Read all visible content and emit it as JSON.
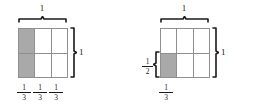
{
  "figure": {
    "type": "fraction-area-model",
    "diagrams": [
      {
        "id": "left",
        "columns": 3,
        "rows": 2,
        "top_brace_label": "1",
        "right_brace_label": "1",
        "shaded_cells": [
          {
            "row": 0,
            "column": 0
          },
          {
            "row": 1,
            "column": 0
          }
        ],
        "shaded_count": 2,
        "bottom_labels": [
          {
            "numerator": "1",
            "denominator": "3"
          },
          {
            "numerator": "1",
            "denominator": "3"
          },
          {
            "numerator": "1",
            "denominator": "3"
          }
        ]
      },
      {
        "id": "right",
        "columns": 3,
        "rows": 2,
        "top_brace_label": "1",
        "right_brace_label": "1",
        "left_brace_label": {
          "numerator": "1",
          "denominator": "2"
        },
        "shaded_cells": [
          {
            "row": 1,
            "column": 0
          }
        ],
        "shaded_count": 1,
        "bottom_labels": [
          {
            "numerator": "1",
            "denominator": "3"
          }
        ]
      }
    ]
  },
  "colors": {
    "shaded_cell": "#a9a9a9",
    "unshaded_cell": "#ffffff",
    "grid_line": "#8f8f8f",
    "brace": "#1a1a1a",
    "text": "#1a1a1a",
    "background": "#ffffff"
  }
}
